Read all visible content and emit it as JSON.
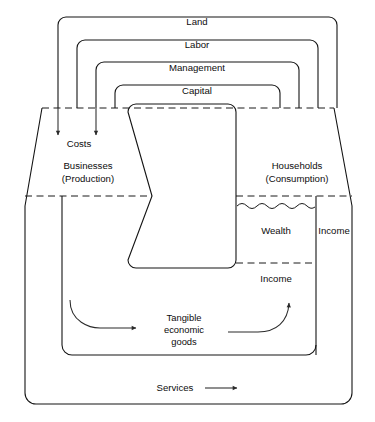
{
  "figure": {
    "background_color": "#ffffff",
    "line_color": "#141414"
  },
  "resource_flows": {
    "loops": [
      {
        "label": "Land"
      },
      {
        "label": "Labor"
      },
      {
        "label": "Management"
      },
      {
        "label": "Capital"
      }
    ]
  },
  "sectors": {
    "left": {
      "line1": "Businesses",
      "line2": "(Production)"
    },
    "right": {
      "line1": "Households",
      "line2": "(Consumption)"
    }
  },
  "annotations": {
    "costs": "Costs",
    "wealth": "Wealth",
    "income_right": "Income",
    "income_lower": "Income",
    "goods_line1": "Tangible",
    "goods_line2": "economic",
    "goods_line3": "goods",
    "services": "Services"
  }
}
